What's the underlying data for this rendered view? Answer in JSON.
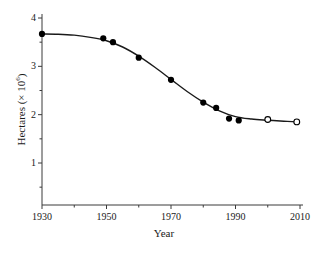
{
  "chart_data": {
    "type": "line",
    "title": "",
    "subtitle": "",
    "xlabel": "Year",
    "ylabel_main": "Hectares (× 10",
    "ylabel_exponent": "6",
    "ylabel_close": ")",
    "ylabel_full": "Hectares (× 10⁶)",
    "xlim": [
      1930,
      2010
    ],
    "ylim": [
      0,
      4
    ],
    "grid": false,
    "legend": "none",
    "x_major_ticks": [
      1930,
      1950,
      1970,
      1990,
      2010
    ],
    "x_major_tick_labels": [
      "1930",
      "1950",
      "1970",
      "1990",
      "2010"
    ],
    "x_minor_ticks": [
      1940,
      1960,
      1980,
      2000
    ],
    "y_major_ticks": [
      1,
      2,
      3,
      4
    ],
    "y_major_tick_labels": [
      "1",
      "2",
      "3",
      "4"
    ],
    "y_minor_ticks": [
      0.5,
      1.5,
      2.5,
      3.5
    ],
    "series": [
      {
        "name": "observed",
        "marker": "filled-circle",
        "marker_color": "#000000",
        "points": [
          {
            "x": 1930,
            "y": 3.67
          },
          {
            "x": 1949,
            "y": 3.58
          },
          {
            "x": 1952,
            "y": 3.5
          },
          {
            "x": 1960,
            "y": 3.18
          },
          {
            "x": 1970,
            "y": 2.72
          },
          {
            "x": 1980,
            "y": 2.25
          },
          {
            "x": 1984,
            "y": 2.14
          },
          {
            "x": 1988,
            "y": 1.92
          },
          {
            "x": 1991,
            "y": 1.88
          }
        ]
      },
      {
        "name": "projected",
        "marker": "open-circle",
        "marker_color": "#000000",
        "points": [
          {
            "x": 2000,
            "y": 1.9
          },
          {
            "x": 2009,
            "y": 1.85
          }
        ]
      }
    ],
    "fitted_curve": [
      {
        "x": 1930,
        "y": 3.67
      },
      {
        "x": 1935,
        "y": 3.665
      },
      {
        "x": 1940,
        "y": 3.645
      },
      {
        "x": 1945,
        "y": 3.6
      },
      {
        "x": 1950,
        "y": 3.53
      },
      {
        "x": 1955,
        "y": 3.4
      },
      {
        "x": 1960,
        "y": 3.21
      },
      {
        "x": 1965,
        "y": 2.98
      },
      {
        "x": 1970,
        "y": 2.73
      },
      {
        "x": 1975,
        "y": 2.48
      },
      {
        "x": 1980,
        "y": 2.26
      },
      {
        "x": 1985,
        "y": 2.08
      },
      {
        "x": 1990,
        "y": 1.96
      },
      {
        "x": 1995,
        "y": 1.91
      },
      {
        "x": 2000,
        "y": 1.885
      },
      {
        "x": 2005,
        "y": 1.865
      },
      {
        "x": 2009,
        "y": 1.85
      }
    ],
    "colors": {
      "line": "#1a1a1a",
      "axis": "#3a3a3a",
      "background": "#ffffff",
      "marker_filled": "#000000",
      "marker_open_stroke": "#000000",
      "marker_open_fill": "#ffffff"
    }
  }
}
